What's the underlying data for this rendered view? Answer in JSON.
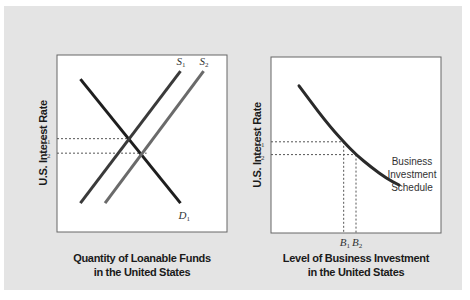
{
  "colors": {
    "background_panel": "#e4e4e4",
    "plot_area": "#ffffff",
    "demand_line": "#1e1e1e",
    "supply_1_line": "#3a3a3a",
    "supply_2_line": "#6a6a6a",
    "investment_curve": "#2a2a2a",
    "dashed_guide": "#555555"
  },
  "chart_data": [
    {
      "type": "line",
      "title": "",
      "xlabel_line1": "Quantity of Loanable Funds",
      "xlabel_line2": "in the United States",
      "ylabel": "U.S. Interest Rate",
      "xlim": [
        0,
        10
      ],
      "ylim": [
        0,
        10
      ],
      "grid": false,
      "series": [
        {
          "name": "D",
          "subscript": "1",
          "points": [
            [
              1,
              9
            ],
            [
              7.5,
              1.3
            ]
          ]
        },
        {
          "name": "S",
          "subscript": "1",
          "points": [
            [
              1,
              1.3
            ],
            [
              7.5,
              9.5
            ]
          ]
        },
        {
          "name": "S",
          "subscript": "2",
          "points": [
            [
              2.6,
              1.3
            ],
            [
              9,
              9.5
            ]
          ]
        }
      ],
      "y_ticks": [
        {
          "base": "i",
          "subscript": "1",
          "value": 5.3
        },
        {
          "base": "i",
          "subscript": "2",
          "value": 4.4
        }
      ],
      "guides": [
        {
          "from_tick": "i1",
          "to_x": 4.4
        },
        {
          "from_tick": "i2",
          "to_x": 5.3
        }
      ]
    },
    {
      "type": "line",
      "title": "",
      "xlabel_line1": "Level of Business Investment",
      "xlabel_line2": "in the United States",
      "ylabel": "U.S. Interest Rate",
      "xlim": [
        0,
        10
      ],
      "ylim": [
        0,
        10
      ],
      "grid": false,
      "series": [
        {
          "name": "Business Investment Schedule",
          "label_lines": [
            "Business",
            "Investment",
            "Schedule"
          ],
          "points": [
            [
              1.3,
              8.7
            ],
            [
              3.0,
              6.5
            ],
            [
              4.2,
              5.2
            ],
            [
              5.0,
              4.4
            ],
            [
              6.0,
              3.6
            ],
            [
              7.0,
              2.9
            ],
            [
              7.8,
              2.5
            ]
          ]
        }
      ],
      "y_ticks": [
        {
          "base": "i",
          "subscript": "1",
          "value": 5.2
        },
        {
          "base": "i",
          "subscript": "2",
          "value": 4.4
        }
      ],
      "x_ticks": [
        {
          "base": "B",
          "subscript": "1",
          "value": 4.2
        },
        {
          "base": "B",
          "subscript": "2",
          "value": 5.0
        }
      ]
    }
  ]
}
